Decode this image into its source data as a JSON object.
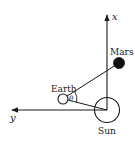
{
  "diagram": {
    "type": "orbital-geometry",
    "axes": {
      "x": {
        "label": "x",
        "direction": "up"
      },
      "y": {
        "label": "y",
        "direction": "left"
      }
    },
    "bodies": {
      "sun": {
        "label": "Sun",
        "fill": "#ffffff"
      },
      "earth": {
        "label": "Earth",
        "fill": "#ffffff"
      },
      "mars": {
        "label": "Mars",
        "fill": "#111111"
      }
    },
    "angle": {
      "symbol": "θ",
      "vertex": "Earth",
      "between": [
        "Earth-Mars line",
        "Earth-Sun line"
      ]
    },
    "colors": {
      "ink": "#1a1a1a",
      "background": "#ffffff"
    }
  }
}
